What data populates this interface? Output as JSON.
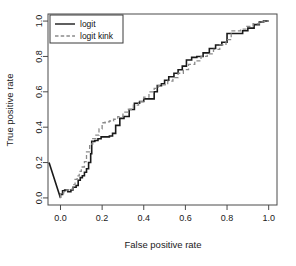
{
  "chart_data": {
    "type": "line",
    "title": "",
    "xlabel": "False positive rate",
    "ylabel": "True positive rate",
    "xlim": [
      -0.06,
      1.04
    ],
    "ylim": [
      -0.04,
      1.04
    ],
    "xticks": [
      0.0,
      0.2,
      0.4,
      0.6,
      0.8,
      1.0
    ],
    "yticks": [
      0.0,
      0.2,
      0.4,
      0.6,
      0.8,
      1.0
    ],
    "xtick_labels": [
      "0.0",
      "0.2",
      "0.4",
      "0.6",
      "0.8",
      "1.0"
    ],
    "ytick_labels": [
      "0.0",
      "0.2",
      "0.4",
      "0.6",
      "0.8",
      "1.0"
    ],
    "grid": false,
    "legend_position": "top-left",
    "series": [
      {
        "name": "logit",
        "color": "#1a1a1a",
        "linestyle": "solid",
        "linewidth": 1.6,
        "x": [
          -0.055,
          0.0,
          0.0,
          0.01,
          0.01,
          0.02,
          0.02,
          0.035,
          0.035,
          0.05,
          0.05,
          0.06,
          0.06,
          0.075,
          0.075,
          0.085,
          0.085,
          0.095,
          0.095,
          0.105,
          0.105,
          0.115,
          0.115,
          0.125,
          0.125,
          0.135,
          0.135,
          0.145,
          0.145,
          0.15,
          0.15,
          0.165,
          0.165,
          0.18,
          0.18,
          0.195,
          0.195,
          0.215,
          0.215,
          0.235,
          0.235,
          0.25,
          0.25,
          0.265,
          0.265,
          0.285,
          0.285,
          0.305,
          0.305,
          0.33,
          0.33,
          0.355,
          0.355,
          0.38,
          0.38,
          0.4,
          0.4,
          0.425,
          0.425,
          0.45,
          0.45,
          0.465,
          0.465,
          0.485,
          0.485,
          0.5,
          0.5,
          0.52,
          0.52,
          0.545,
          0.545,
          0.565,
          0.565,
          0.585,
          0.585,
          0.605,
          0.605,
          0.63,
          0.63,
          0.655,
          0.655,
          0.685,
          0.685,
          0.715,
          0.715,
          0.745,
          0.745,
          0.775,
          0.775,
          0.8,
          0.8,
          0.875,
          0.875,
          0.9,
          0.9,
          0.93,
          0.93,
          0.955,
          0.955,
          0.975,
          0.975,
          1.0
        ],
        "y": [
          0.2,
          0.0,
          0.02,
          0.02,
          0.04,
          0.04,
          0.045,
          0.045,
          0.035,
          0.035,
          0.045,
          0.045,
          0.06,
          0.06,
          0.07,
          0.07,
          0.1,
          0.1,
          0.115,
          0.115,
          0.125,
          0.125,
          0.145,
          0.145,
          0.165,
          0.165,
          0.2,
          0.2,
          0.25,
          0.25,
          0.32,
          0.32,
          0.325,
          0.325,
          0.335,
          0.335,
          0.345,
          0.345,
          0.345,
          0.345,
          0.35,
          0.35,
          0.365,
          0.365,
          0.41,
          0.41,
          0.45,
          0.45,
          0.46,
          0.46,
          0.5,
          0.5,
          0.535,
          0.535,
          0.545,
          0.545,
          0.56,
          0.56,
          0.56,
          0.56,
          0.6,
          0.6,
          0.635,
          0.635,
          0.645,
          0.645,
          0.665,
          0.665,
          0.685,
          0.685,
          0.705,
          0.705,
          0.725,
          0.725,
          0.745,
          0.745,
          0.78,
          0.78,
          0.795,
          0.795,
          0.8,
          0.8,
          0.82,
          0.82,
          0.845,
          0.845,
          0.865,
          0.865,
          0.88,
          0.88,
          0.93,
          0.93,
          0.945,
          0.945,
          0.96,
          0.96,
          0.98,
          0.98,
          0.995,
          0.995,
          1.0,
          1.0
        ]
      },
      {
        "name": "logit kink",
        "color": "#8a8a8a",
        "linestyle": "dashed",
        "linewidth": 1.3,
        "x": [
          0.0,
          0.0,
          0.015,
          0.015,
          0.03,
          0.03,
          0.045,
          0.045,
          0.06,
          0.06,
          0.07,
          0.07,
          0.08,
          0.08,
          0.09,
          0.09,
          0.1,
          0.1,
          0.115,
          0.115,
          0.125,
          0.125,
          0.14,
          0.14,
          0.155,
          0.155,
          0.17,
          0.17,
          0.185,
          0.185,
          0.2,
          0.2,
          0.215,
          0.215,
          0.235,
          0.235,
          0.255,
          0.255,
          0.275,
          0.275,
          0.3,
          0.3,
          0.325,
          0.325,
          0.35,
          0.35,
          0.375,
          0.375,
          0.4,
          0.4,
          0.425,
          0.425,
          0.45,
          0.45,
          0.47,
          0.47,
          0.49,
          0.49,
          0.515,
          0.515,
          0.54,
          0.54,
          0.565,
          0.565,
          0.59,
          0.59,
          0.615,
          0.615,
          0.645,
          0.645,
          0.675,
          0.675,
          0.705,
          0.705,
          0.735,
          0.735,
          0.765,
          0.765,
          0.795,
          0.795,
          0.82,
          0.82,
          0.865,
          0.865,
          0.895,
          0.895,
          0.925,
          0.925,
          0.955,
          0.955,
          0.98,
          0.98,
          1.0
        ],
        "y": [
          0.0,
          0.025,
          0.025,
          0.035,
          0.035,
          0.045,
          0.045,
          0.05,
          0.05,
          0.075,
          0.075,
          0.105,
          0.105,
          0.125,
          0.125,
          0.15,
          0.15,
          0.175,
          0.175,
          0.205,
          0.205,
          0.26,
          0.26,
          0.305,
          0.305,
          0.335,
          0.335,
          0.355,
          0.355,
          0.39,
          0.39,
          0.425,
          0.425,
          0.43,
          0.43,
          0.435,
          0.435,
          0.445,
          0.445,
          0.46,
          0.46,
          0.485,
          0.485,
          0.5,
          0.5,
          0.525,
          0.525,
          0.545,
          0.545,
          0.57,
          0.57,
          0.6,
          0.6,
          0.62,
          0.62,
          0.635,
          0.635,
          0.64,
          0.64,
          0.66,
          0.66,
          0.68,
          0.68,
          0.705,
          0.705,
          0.725,
          0.725,
          0.755,
          0.755,
          0.775,
          0.775,
          0.8,
          0.8,
          0.815,
          0.815,
          0.84,
          0.84,
          0.865,
          0.865,
          0.895,
          0.895,
          0.945,
          0.945,
          0.955,
          0.955,
          0.97,
          0.97,
          0.985,
          0.985,
          0.995,
          0.995,
          1.0,
          1.0
        ]
      }
    ],
    "legend": [
      {
        "label": "logit",
        "linestyle": "solid",
        "color": "#1a1a1a"
      },
      {
        "label": "logit kink",
        "linestyle": "dashed",
        "color": "#8a8a8a"
      }
    ]
  }
}
